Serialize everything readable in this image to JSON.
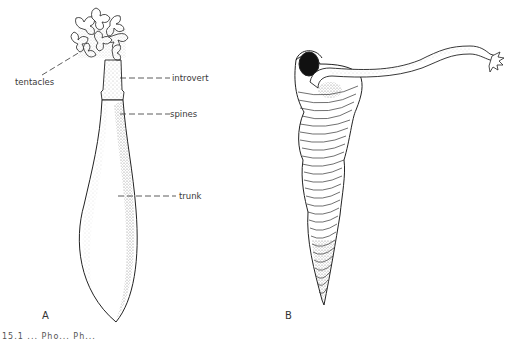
{
  "figure": {
    "panels": [
      {
        "id": "A",
        "letter": "A",
        "labels": {
          "tentacles": "tentacles",
          "introvert": "introvert",
          "spines": "spines",
          "trunk": "trunk"
        }
      },
      {
        "id": "B",
        "letter": "B"
      }
    ],
    "caption_partial": "15.1 ... Pho... Ph..."
  }
}
